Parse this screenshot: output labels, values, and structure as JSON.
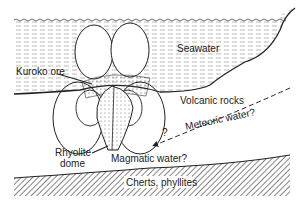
{
  "diagram": {
    "labels": {
      "seawater": "Seawater",
      "kuroko_ore": "Kuroko ore",
      "volcanic_rocks": "Volcanic rocks",
      "meteoric_water": "Meteoric water?",
      "question": "?",
      "rhyolite_line1": "Rhyolite",
      "rhyolite_line2": "dome",
      "magmatic_water": "Magmatic water?",
      "cherts": "Cherts, phyllites"
    }
  }
}
